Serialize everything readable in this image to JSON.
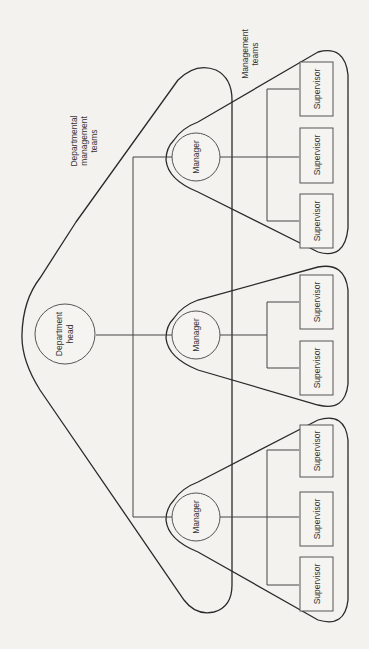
{
  "diagram": {
    "type": "organization-chart",
    "orientation": "rotated-90-ccw",
    "labels": {
      "departmental_group": [
        "Departmental",
        "management",
        "teams"
      ],
      "management_group": [
        "Management",
        "teams"
      ]
    },
    "department_head": {
      "label_lines": [
        "Department",
        "head"
      ]
    },
    "managers": [
      {
        "label": "Manager",
        "supervisors": [
          "Supervisor",
          "Supervisor",
          "Supervisor"
        ]
      },
      {
        "label": "Manager",
        "supervisors": [
          "Supervisor",
          "Supervisor"
        ]
      },
      {
        "label": "Manager",
        "supervisors": [
          "Supervisor",
          "Supervisor",
          "Supervisor"
        ]
      }
    ],
    "colors": {
      "background": "#f3f2ef",
      "line": "#2a2a2a"
    }
  }
}
